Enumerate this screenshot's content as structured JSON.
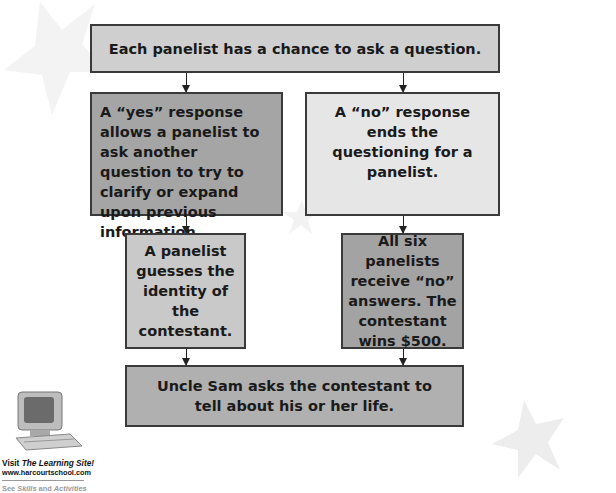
{
  "flowchart": {
    "start": "Each panelist has a chance to ask a question.",
    "yes_branch": "A “yes” response allows a panelist to ask another question to try to clarify or expand upon previous information.",
    "no_branch": "A “no” response ends the questioning for a panelist.",
    "guess_outcome": "A panelist guesses the identity of the contestant.",
    "all_no_outcome": "All six panelists receive “no” answers. The contestant wins $500.",
    "end": "Uncle Sam asks the contestant to tell about his or her life."
  },
  "promo": {
    "visit_prefix": "Visit ",
    "site_name": "The Learning Site!",
    "url": "www.harcourtschool.com",
    "see_prefix": "See ",
    "see_skills": "Skills",
    "see_and": " and ",
    "see_activities": "Activities"
  }
}
